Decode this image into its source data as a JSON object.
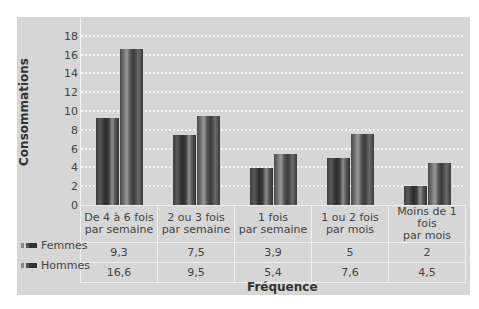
{
  "chart_data": {
    "type": "bar",
    "title": "",
    "xlabel": "Fréquence",
    "ylabel": "Consommations",
    "ylim": [
      0,
      18
    ],
    "yticks": [
      0,
      2,
      4,
      6,
      8,
      10,
      12,
      14,
      16,
      18
    ],
    "grid": true,
    "categories": [
      "De 4 à 6 fois par semaine",
      "2 ou 3 fois par semaine",
      "1 fois par semaine",
      "1 ou 2 fois par mois",
      "Moins de 1 fois par mois"
    ],
    "category_lines": [
      [
        "De 4 à 6 fois",
        "par semaine"
      ],
      [
        "2 ou 3 fois",
        "par semaine"
      ],
      [
        "1 fois",
        "par semaine"
      ],
      [
        "1 ou 2 fois",
        "par mois"
      ],
      [
        "Moins de 1 fois",
        "par mois"
      ]
    ],
    "series": [
      {
        "name": "Femmes",
        "values": [
          9.3,
          7.5,
          3.9,
          5,
          2
        ],
        "labels": [
          "9,3",
          "7,5",
          "3,9",
          "5",
          "2"
        ]
      },
      {
        "name": "Hommes",
        "values": [
          16.6,
          9.5,
          5.4,
          7.6,
          4.5
        ],
        "labels": [
          "16,6",
          "9,5",
          "5,4",
          "7,6",
          "4,5"
        ]
      }
    ],
    "legend_position": "left of data table"
  },
  "labels": {
    "ylabel": "Consommations",
    "xlabel": "Fréquence",
    "yticks": [
      "0",
      "2",
      "4",
      "6",
      "8",
      "10",
      "12",
      "14",
      "16",
      "18"
    ],
    "legend": [
      "Femmes",
      "Hommes"
    ],
    "headers": [
      [
        "De 4 à 6 fois",
        "par semaine"
      ],
      [
        "2 ou 3 fois",
        "par semaine"
      ],
      [
        "1 fois",
        "par semaine"
      ],
      [
        "1 ou 2 fois",
        "par mois"
      ],
      [
        "Moins de 1 fois",
        "par mois"
      ]
    ],
    "femmes": [
      "9,3",
      "7,5",
      "3,9",
      "5",
      "2"
    ],
    "hommes": [
      "16,6",
      "9,5",
      "5,4",
      "7,6",
      "4,5"
    ]
  },
  "colors": {
    "panel_bg": "#d6d6d6",
    "grid": "#f4f4f4",
    "bar_dark": "#3c3c3c",
    "bar_light": "#8f8f8f"
  }
}
